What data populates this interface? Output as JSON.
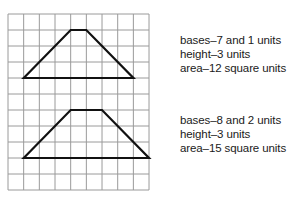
{
  "grid": {
    "columns": 9,
    "rows": 11,
    "origin_x": 8,
    "origin_y": 14,
    "cell_width": 15.67,
    "cell_height": 16,
    "line_color": "#9a9a9a"
  },
  "shapes": [
    {
      "name": "trapezoid-1",
      "stroke_color": "#111111",
      "vertices_grid": [
        [
          1,
          4
        ],
        [
          4,
          1
        ],
        [
          5,
          1
        ],
        [
          8,
          4
        ]
      ],
      "bases": "7 and 1 units",
      "height": "3 units",
      "area": "12 square units"
    },
    {
      "name": "trapezoid-2",
      "stroke_color": "#111111",
      "vertices_grid": [
        [
          1,
          9
        ],
        [
          4,
          6
        ],
        [
          6,
          6
        ],
        [
          9,
          9
        ]
      ],
      "bases": "8 and 2 units",
      "height": "3 units",
      "area": "15 square units"
    }
  ],
  "labels": [
    {
      "bases": "bases–7 and 1 units",
      "height": "height–3 units",
      "area": "area–12 square units"
    },
    {
      "bases": "bases–8 and 2 units",
      "height": "height–3 units",
      "area": "area–15 square units"
    }
  ]
}
